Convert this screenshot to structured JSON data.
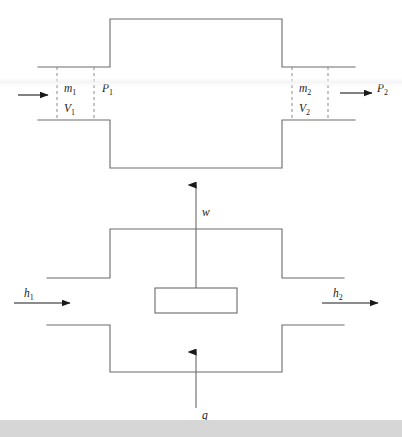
{
  "figure": {
    "colors": {
      "line": "#6b6b6b",
      "dash": "#8a8a8a",
      "arrow": "#1a1a1a",
      "text": "#1a1a1a",
      "background": "#ffffff",
      "footer_strip": "#d6d6d6"
    },
    "upper": {
      "inlet_mass": "m",
      "inlet_mass_sub": "1",
      "inlet_volume": "V",
      "inlet_volume_sub": "1",
      "inlet_pressure": "P",
      "inlet_pressure_sub": "1",
      "outlet_mass": "m",
      "outlet_mass_sub": "2",
      "outlet_volume": "V",
      "outlet_volume_sub": "2",
      "outlet_pressure": "P",
      "outlet_pressure_sub": "2"
    },
    "lower": {
      "inlet_enthalpy": "h",
      "inlet_enthalpy_sub": "1",
      "outlet_enthalpy": "h",
      "outlet_enthalpy_sub": "2",
      "work": "w",
      "heat": "q"
    }
  }
}
